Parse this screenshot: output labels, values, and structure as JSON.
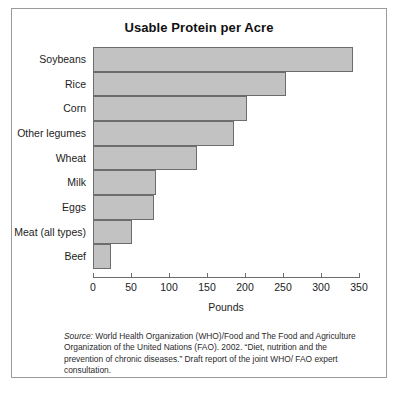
{
  "chart_data": {
    "type": "bar",
    "orientation": "horizontal",
    "title": "Usable Protein per Acre",
    "xlabel": "Pounds",
    "ylabel": "",
    "xlim": [
      0,
      350
    ],
    "xticks": [
      0,
      50,
      100,
      150,
      200,
      250,
      300,
      350
    ],
    "grid": false,
    "legend": "none",
    "categories": [
      "Soybeans",
      "Rice",
      "Corn",
      "Other legumes",
      "Wheat",
      "Milk",
      "Eggs",
      "Meat (all types)",
      "Beef"
    ],
    "values": [
      342,
      254,
      203,
      186,
      137,
      83,
      80,
      51,
      24
    ],
    "bar_color": "#c2c2c2",
    "bar_edge_color": "#6d6d6d",
    "axis_color": "#6d6d6d"
  },
  "figure": {
    "title": "Usable Protein per Acre",
    "axis_title_x": "Pounds",
    "border_color": "#9a9a9a",
    "background": "#ffffff"
  },
  "source": {
    "label": "Source:",
    "text": " World Health Organization (WHO)/Food and The Food and Agriculture Organization of the United Nations (FAO). 2002. “Diet, nutrition and the prevention of chronic diseases.” Draft report of the joint WHO/ FAO expert consultation."
  }
}
